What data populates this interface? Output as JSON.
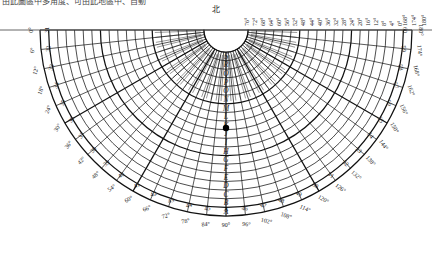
{
  "page": {
    "top_note": "由此圖區中多角度、可由此地區中、自動",
    "width": 432,
    "height": 256,
    "background": "#ffffff",
    "line_color": "#111111",
    "text_color": "#1a1a1a"
  },
  "labels": {
    "north": "北",
    "north_symbol_name": "north-character"
  },
  "marker": {
    "name": "data-point-marker",
    "x": 226,
    "y": 128,
    "radius": 3.2,
    "color": "#000000"
  },
  "chart_data": {
    "type": "polar-fan-grid",
    "title": "北",
    "xlabel": "",
    "ylabel": "",
    "angle_range": [
      0,
      180
    ],
    "outer_tick_step": 6,
    "top_tick_step": 4,
    "grid": true,
    "legend": "none",
    "outer_angle_labels": [
      "0°",
      "6°",
      "12°",
      "18°",
      "24°",
      "30°",
      "36°",
      "42°",
      "48°",
      "54°",
      "60°",
      "66°",
      "72°",
      "78°",
      "84°",
      "90°",
      "96°",
      "102°",
      "108°",
      "114°",
      "120°",
      "126°",
      "132°",
      "138°",
      "144°",
      "150°",
      "156°",
      "162°",
      "168°",
      "174°",
      "180°"
    ],
    "top_angle_labels_left": [],
    "top_angle_labels_right": [
      "76°",
      "72°",
      "68°",
      "64°",
      "60°",
      "56°",
      "52°",
      "48°",
      "44°",
      "40°",
      "36°",
      "32°",
      "28°",
      "24°",
      "20°",
      "16°",
      "12°",
      "8°",
      "4°",
      "0°"
    ],
    "sector_codes": [
      "31",
      "32",
      "33",
      "34",
      "35",
      "36",
      "37",
      "38",
      "39",
      "40",
      "41",
      "42",
      "43",
      "44",
      "45",
      "A",
      "46",
      "47",
      "48",
      "49",
      "50",
      "51",
      "52",
      "53",
      "54",
      "55",
      "56",
      "57",
      "58",
      "59",
      "60"
    ],
    "center_column_letters": [
      "S",
      "R",
      "Q",
      "P",
      "O",
      "N",
      "M",
      "L",
      "K",
      "J",
      "I",
      "H",
      "G",
      "F",
      "E",
      "D",
      "C",
      "B",
      "A"
    ],
    "radial_line_count": 31,
    "arc_count": 19
  },
  "geometry": {
    "center_x": 226,
    "center_y": 30,
    "inner_radius": 22,
    "outer_radius": 186,
    "start_angle_deg": 0,
    "end_angle_deg": 180
  }
}
